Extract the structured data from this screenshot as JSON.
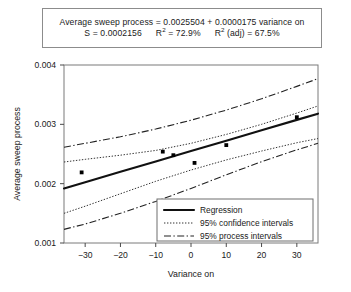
{
  "caption": {
    "line1_prefix": "Average sweep process = 0.0025504 + 0.0000175 variance on",
    "s_label": "S = 0.0002156",
    "r2_label": "R",
    "r2_sup": "2",
    "r2_value": " = 72.9%",
    "r2adj_label": "R",
    "r2adj_sup": "2",
    "r2adj_value": " (adj) = 67.5%"
  },
  "chart_data": {
    "type": "scatter",
    "title": "",
    "xlabel": "Variance on",
    "ylabel": "Average sweep process",
    "xlim": [
      -36,
      36
    ],
    "ylim": [
      0.001,
      0.004
    ],
    "xticks": [
      -30,
      -20,
      -10,
      0,
      10,
      20,
      30
    ],
    "xticklabels": [
      "-30",
      "-20",
      "-10",
      "0",
      "10",
      "20",
      "30"
    ],
    "yticks": [
      0.001,
      0.002,
      0.003,
      0.004
    ],
    "yticklabels": [
      "0.001",
      "0.002",
      "0.003",
      "0.004"
    ],
    "grid": false,
    "legend_position": "lower right",
    "regression": {
      "intercept": 0.0025504,
      "slope": 1.75e-05,
      "s": 0.0002156,
      "r_squared": 72.9,
      "r_squared_adj": 67.5
    },
    "points": {
      "x": [
        -31,
        -8,
        -5,
        1,
        10,
        30
      ],
      "y": [
        0.00219,
        0.00254,
        0.00248,
        0.00235,
        0.00265,
        0.00312
      ]
    },
    "series": [
      {
        "name": "Regression",
        "style": "solid",
        "x": [
          -36,
          -30,
          -20,
          -10,
          0,
          10,
          20,
          30,
          36
        ],
        "y": [
          0.00192,
          0.002025,
          0.0022,
          0.002375,
          0.00255,
          0.002725,
          0.0029,
          0.003075,
          0.00318
        ]
      },
      {
        "name": "95% confidence intervals",
        "style": "dotted",
        "x": [
          -36,
          -30,
          -20,
          -10,
          0,
          10,
          20,
          30,
          36
        ],
        "y": [
          0.002365,
          0.00241,
          0.00248,
          0.00256,
          0.00268,
          0.00283,
          0.003,
          0.00319,
          0.00331
        ]
      },
      {
        "name": "95% confidence intervals",
        "style": "dotted",
        "x": [
          -36,
          -30,
          -20,
          -10,
          0,
          10,
          20,
          30,
          36
        ],
        "y": [
          0.0015,
          0.00162,
          0.00183,
          0.00204,
          0.00223,
          0.0024,
          0.00255,
          0.00269,
          0.00276
        ]
      },
      {
        "name": "95% process intervals",
        "style": "dashdot",
        "x": [
          -36,
          -30,
          -20,
          -10,
          0,
          10,
          20,
          30,
          36
        ],
        "y": [
          0.002615,
          0.00268,
          0.00279,
          0.00292,
          0.00307,
          0.00324,
          0.00343,
          0.00364,
          0.00377
        ]
      },
      {
        "name": "95% process intervals",
        "style": "dashdot",
        "x": [
          -36,
          -30,
          -20,
          -10,
          0,
          10,
          20,
          30,
          36
        ],
        "y": [
          0.00123,
          0.00132,
          0.0015,
          0.0017,
          0.00192,
          0.00215,
          0.00237,
          0.00257,
          0.00268
        ]
      }
    ],
    "legend": [
      {
        "label": "Regression",
        "style": "solid"
      },
      {
        "label": "95% confidence intervals",
        "style": "dotted"
      },
      {
        "label": "95% process intervals",
        "style": "dashdot"
      }
    ]
  }
}
